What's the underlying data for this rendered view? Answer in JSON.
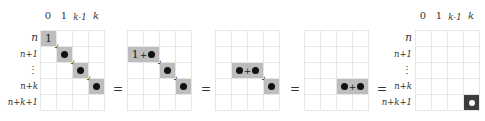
{
  "col_labels": [
    "0",
    "1",
    "k-1",
    "k"
  ],
  "row_labels": [
    "n",
    "n+1",
    "⋮",
    "n+k",
    "n+k+1"
  ],
  "equals": "=",
  "plus": "+",
  "one": "1",
  "colors": {
    "highlight": "#bdbdbd",
    "dark_cell": "#3c3c3c",
    "grid_line": "#e6e6e6"
  },
  "panels": [
    {
      "id": 1,
      "cells": [
        {
          "row": 0,
          "col": 0,
          "span": 1,
          "content": "1"
        },
        {
          "row": 1,
          "col": 1,
          "span": 1,
          "content": "•"
        },
        {
          "row": 2,
          "col": 2,
          "span": 1,
          "content": "•"
        },
        {
          "row": 3,
          "col": 3,
          "span": 1,
          "content": "•"
        }
      ]
    },
    {
      "id": 2,
      "cells": [
        {
          "row": 1,
          "col": 0,
          "span": 2,
          "content": "1+•"
        },
        {
          "row": 2,
          "col": 2,
          "span": 1,
          "content": "•"
        },
        {
          "row": 3,
          "col": 3,
          "span": 1,
          "content": "•"
        }
      ]
    },
    {
      "id": 3,
      "cells": [
        {
          "row": 2,
          "col": 1,
          "span": 2,
          "content": "•+•"
        },
        {
          "row": 3,
          "col": 3,
          "span": 1,
          "content": "•"
        }
      ]
    },
    {
      "id": 4,
      "cells": [
        {
          "row": 3,
          "col": 2,
          "span": 2,
          "content": "•+•"
        }
      ]
    },
    {
      "id": 5,
      "cells": [
        {
          "row": 4,
          "col": 3,
          "span": 1,
          "content": "white-dot",
          "dark": true
        }
      ]
    }
  ]
}
